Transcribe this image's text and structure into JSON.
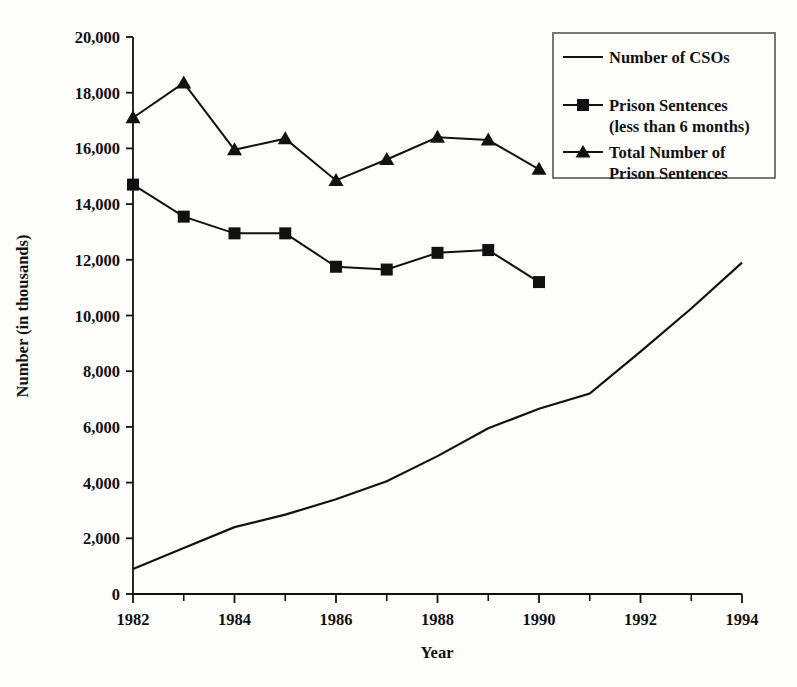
{
  "chart_data": {
    "type": "line",
    "title": "",
    "xlabel": "Year",
    "ylabel": "Number (in thousands)",
    "xlim": [
      1982,
      1994
    ],
    "ylim": [
      0,
      20000
    ],
    "grid": false,
    "legend_position": "top-right",
    "x_tick_labels": [
      "1982",
      "1984",
      "1986",
      "1988",
      "1990",
      "1992",
      "1994"
    ],
    "x_tick_values": [
      1982,
      1984,
      1986,
      1988,
      1990,
      1992,
      1994
    ],
    "x_minor_ticks": [
      1983,
      1985,
      1987,
      1989,
      1991,
      1993
    ],
    "y_tick_labels": [
      "0",
      "2,000",
      "4,000",
      "6,000",
      "8,000",
      "10,000",
      "12,000",
      "14,000",
      "16,000",
      "18,000",
      "20,000"
    ],
    "y_tick_values": [
      0,
      2000,
      4000,
      6000,
      8000,
      10000,
      12000,
      14000,
      16000,
      18000,
      20000
    ],
    "series": [
      {
        "name": "Number of CSOs",
        "marker": "none",
        "x": [
          1982,
          1983,
          1984,
          1985,
          1986,
          1987,
          1988,
          1989,
          1990,
          1991,
          1992,
          1993,
          1994
        ],
        "values": [
          900,
          1650,
          2400,
          2850,
          3400,
          4050,
          4950,
          5950,
          6650,
          7200,
          8700,
          10250,
          11900
        ]
      },
      {
        "name": "Prison Sentences (less than 6 months)",
        "marker": "square",
        "x": [
          1982,
          1983,
          1984,
          1985,
          1986,
          1987,
          1988,
          1989,
          1990
        ],
        "values": [
          14700,
          13550,
          12950,
          12950,
          11750,
          11650,
          12250,
          12350,
          11200
        ]
      },
      {
        "name": "Total Number of Prison Sentences",
        "marker": "triangle",
        "x": [
          1982,
          1983,
          1984,
          1985,
          1986,
          1987,
          1988,
          1989,
          1990
        ],
        "values": [
          17100,
          18350,
          15950,
          16350,
          14850,
          15600,
          16400,
          16300,
          15250
        ]
      }
    ]
  },
  "legend": {
    "entries": [
      {
        "label_line1": "Number of CSOs",
        "label_line2": "",
        "marker": "none"
      },
      {
        "label_line1": "Prison Sentences",
        "label_line2": "(less than 6 months)",
        "marker": "square"
      },
      {
        "label_line1": "Total Number of",
        "label_line2": "Prison Sentences",
        "marker": "triangle"
      }
    ]
  },
  "colors": {
    "ink": "#111111",
    "background": "#fdfdfb",
    "legend_border": "#555555"
  }
}
